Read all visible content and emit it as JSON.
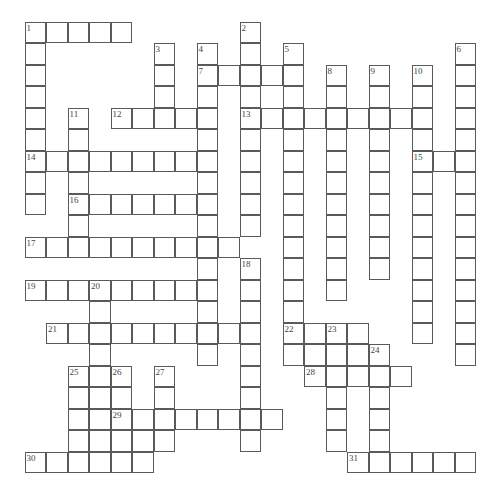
{
  "puzzle": {
    "type": "crossword",
    "origin": {
      "x": 25,
      "y": 22
    },
    "cell_size": 21.5,
    "colors": {
      "border": "#5a5a5a",
      "background": "#ffffff",
      "number": "#444444"
    },
    "words": [
      {
        "number": 1,
        "dir": "across",
        "row": 0,
        "col": 0,
        "length": 5
      },
      {
        "number": 1,
        "dir": "down",
        "row": 0,
        "col": 0,
        "length": 9
      },
      {
        "number": 2,
        "dir": "down",
        "row": 0,
        "col": 10,
        "length": 10
      },
      {
        "number": 3,
        "dir": "down",
        "row": 1,
        "col": 6,
        "length": 4
      },
      {
        "number": 4,
        "dir": "down",
        "row": 1,
        "col": 8,
        "length": 15
      },
      {
        "number": 5,
        "dir": "down",
        "row": 1,
        "col": 12,
        "length": 15
      },
      {
        "number": 6,
        "dir": "down",
        "row": 1,
        "col": 20,
        "length": 15
      },
      {
        "number": 7,
        "dir": "across",
        "row": 2,
        "col": 8,
        "length": 5
      },
      {
        "number": 8,
        "dir": "down",
        "row": 2,
        "col": 14,
        "length": 11
      },
      {
        "number": 9,
        "dir": "down",
        "row": 2,
        "col": 16,
        "length": 10
      },
      {
        "number": 10,
        "dir": "down",
        "row": 2,
        "col": 18,
        "length": 13
      },
      {
        "number": 11,
        "dir": "down",
        "row": 4,
        "col": 2,
        "length": 7
      },
      {
        "number": 12,
        "dir": "across",
        "row": 4,
        "col": 4,
        "length": 5
      },
      {
        "number": 13,
        "dir": "across",
        "row": 4,
        "col": 10,
        "length": 9
      },
      {
        "number": 14,
        "dir": "across",
        "row": 6,
        "col": 0,
        "length": 9
      },
      {
        "number": 15,
        "dir": "across",
        "row": 6,
        "col": 18,
        "length": 3
      },
      {
        "number": 16,
        "dir": "across",
        "row": 8,
        "col": 2,
        "length": 7
      },
      {
        "number": 17,
        "dir": "across",
        "row": 10,
        "col": 0,
        "length": 10
      },
      {
        "number": 18,
        "dir": "down",
        "row": 11,
        "col": 10,
        "length": 9
      },
      {
        "number": 19,
        "dir": "across",
        "row": 12,
        "col": 0,
        "length": 9
      },
      {
        "number": 20,
        "dir": "down",
        "row": 12,
        "col": 3,
        "length": 9
      },
      {
        "number": 21,
        "dir": "across",
        "row": 14,
        "col": 1,
        "length": 10
      },
      {
        "number": 22,
        "dir": "across",
        "row": 14,
        "col": 12,
        "length": 4
      },
      {
        "number": 23,
        "dir": "down",
        "row": 14,
        "col": 14,
        "length": 6
      },
      {
        "number": 24,
        "dir": "down",
        "row": 15,
        "col": 16,
        "length": 6
      },
      {
        "number": null,
        "dir": "across",
        "row": 15,
        "col": 12,
        "length": 5
      },
      {
        "number": 25,
        "dir": "down",
        "row": 16,
        "col": 2,
        "length": 5
      },
      {
        "number": 26,
        "dir": "down",
        "row": 16,
        "col": 4,
        "length": 5
      },
      {
        "number": 27,
        "dir": "down",
        "row": 16,
        "col": 6,
        "length": 4
      },
      {
        "number": 28,
        "dir": "across",
        "row": 16,
        "col": 13,
        "length": 5
      },
      {
        "number": 29,
        "dir": "across",
        "row": 18,
        "col": 4,
        "length": 8
      },
      {
        "number": null,
        "dir": "across",
        "row": 19,
        "col": 2,
        "length": 5
      },
      {
        "number": 30,
        "dir": "across",
        "row": 20,
        "col": 0,
        "length": 6
      },
      {
        "number": 31,
        "dir": "across",
        "row": 20,
        "col": 15,
        "length": 6
      }
    ]
  }
}
